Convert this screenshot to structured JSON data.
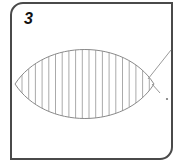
{
  "panel": {
    "number": "3"
  },
  "figure": {
    "shape": "lens",
    "hatch": "vertical-lines",
    "hatch_line_count": 20,
    "colors": {
      "frame": "#4a4a4a",
      "outline": "#8a8a8a",
      "hatch": "#a0a0a0",
      "pointer_line": "#9a9a9a",
      "label_text": "#111111"
    }
  }
}
